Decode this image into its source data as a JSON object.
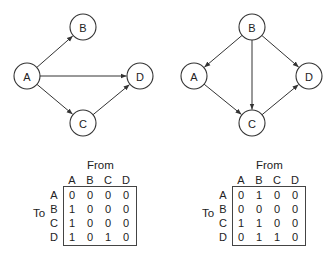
{
  "graphs": [
    {
      "nodes": [
        {
          "id": "A",
          "label": "A",
          "x": 27,
          "y": 76
        },
        {
          "id": "B",
          "label": "B",
          "x": 83,
          "y": 27
        },
        {
          "id": "C",
          "label": "C",
          "x": 83,
          "y": 123
        },
        {
          "id": "D",
          "label": "D",
          "x": 140,
          "y": 76
        }
      ],
      "edges": [
        {
          "from": "A",
          "to": "B"
        },
        {
          "from": "A",
          "to": "D"
        },
        {
          "from": "A",
          "to": "C"
        },
        {
          "from": "C",
          "to": "D"
        }
      ],
      "matrix": {
        "from_label": "From",
        "to_label": "To",
        "columns": [
          "A",
          "B",
          "C",
          "D"
        ],
        "rows": [
          "A",
          "B",
          "C",
          "D"
        ],
        "values": [
          [
            "0",
            "0",
            "0",
            "0"
          ],
          [
            "1",
            "0",
            "0",
            "0"
          ],
          [
            "1",
            "0",
            "0",
            "0"
          ],
          [
            "1",
            "0",
            "1",
            "0"
          ]
        ]
      }
    },
    {
      "nodes": [
        {
          "id": "A",
          "label": "A",
          "x": 194,
          "y": 76
        },
        {
          "id": "B",
          "label": "B",
          "x": 252,
          "y": 27
        },
        {
          "id": "C",
          "label": "C",
          "x": 252,
          "y": 123
        },
        {
          "id": "D",
          "label": "D",
          "x": 309,
          "y": 76
        }
      ],
      "edges": [
        {
          "from": "B",
          "to": "A"
        },
        {
          "from": "B",
          "to": "C"
        },
        {
          "from": "B",
          "to": "D"
        },
        {
          "from": "A",
          "to": "C"
        },
        {
          "from": "C",
          "to": "D"
        }
      ],
      "matrix": {
        "from_label": "From",
        "to_label": "To",
        "columns": [
          "A",
          "B",
          "C",
          "D"
        ],
        "rows": [
          "A",
          "B",
          "C",
          "D"
        ],
        "values": [
          [
            "0",
            "1",
            "0",
            "0"
          ],
          [
            "0",
            "0",
            "0",
            "0"
          ],
          [
            "1",
            "1",
            "0",
            "0"
          ],
          [
            "0",
            "1",
            "1",
            "0"
          ]
        ]
      }
    }
  ]
}
